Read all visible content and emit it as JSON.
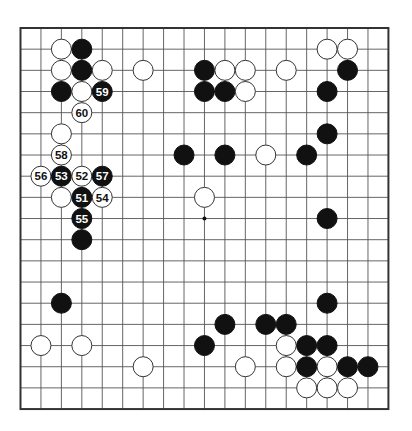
{
  "board": {
    "size": 19,
    "origin": {
      "x": 20.5,
      "y": 28
    },
    "spacing": {
      "x": 20.44,
      "y": 21.17
    },
    "stone_radius": 10,
    "colors": {
      "line": "#555555",
      "border": "#333333",
      "black": "#111111",
      "white": "#ffffff",
      "white_outline": "#333333",
      "black_label": "#ffffff",
      "white_label": "#111111"
    },
    "star_points": [
      [
        9,
        9
      ]
    ],
    "stones": [
      {
        "c": 2,
        "r": 1,
        "color": "white"
      },
      {
        "c": 3,
        "r": 1,
        "color": "black"
      },
      {
        "c": 15,
        "r": 1,
        "color": "white"
      },
      {
        "c": 16,
        "r": 1,
        "color": "white"
      },
      {
        "c": 2,
        "r": 2,
        "color": "white"
      },
      {
        "c": 3,
        "r": 2,
        "color": "black"
      },
      {
        "c": 4,
        "r": 2,
        "color": "white"
      },
      {
        "c": 6,
        "r": 2,
        "color": "white"
      },
      {
        "c": 9,
        "r": 2,
        "color": "black"
      },
      {
        "c": 10,
        "r": 2,
        "color": "white"
      },
      {
        "c": 11,
        "r": 2,
        "color": "white"
      },
      {
        "c": 13,
        "r": 2,
        "color": "white"
      },
      {
        "c": 16,
        "r": 2,
        "color": "black"
      },
      {
        "c": 2,
        "r": 3,
        "color": "black"
      },
      {
        "c": 3,
        "r": 3,
        "color": "white"
      },
      {
        "c": 4,
        "r": 3,
        "color": "black",
        "label": "59"
      },
      {
        "c": 9,
        "r": 3,
        "color": "black"
      },
      {
        "c": 10,
        "r": 3,
        "color": "black"
      },
      {
        "c": 11,
        "r": 3,
        "color": "white"
      },
      {
        "c": 15,
        "r": 3,
        "color": "black"
      },
      {
        "c": 3,
        "r": 4,
        "color": "white",
        "label": "60"
      },
      {
        "c": 2,
        "r": 5,
        "color": "white"
      },
      {
        "c": 15,
        "r": 5,
        "color": "black"
      },
      {
        "c": 2,
        "r": 6,
        "color": "white",
        "label": "58"
      },
      {
        "c": 8,
        "r": 6,
        "color": "black"
      },
      {
        "c": 10,
        "r": 6,
        "color": "black"
      },
      {
        "c": 12,
        "r": 6,
        "color": "white"
      },
      {
        "c": 14,
        "r": 6,
        "color": "black"
      },
      {
        "c": 1,
        "r": 7,
        "color": "white",
        "label": "56"
      },
      {
        "c": 2,
        "r": 7,
        "color": "black",
        "label": "53"
      },
      {
        "c": 3,
        "r": 7,
        "color": "white",
        "label": "52"
      },
      {
        "c": 4,
        "r": 7,
        "color": "black",
        "label": "57"
      },
      {
        "c": 2,
        "r": 8,
        "color": "white"
      },
      {
        "c": 3,
        "r": 8,
        "color": "black",
        "label": "51"
      },
      {
        "c": 4,
        "r": 8,
        "color": "white",
        "label": "54"
      },
      {
        "c": 9,
        "r": 8,
        "color": "white"
      },
      {
        "c": 3,
        "r": 9,
        "color": "black",
        "label": "55"
      },
      {
        "c": 15,
        "r": 9,
        "color": "black"
      },
      {
        "c": 3,
        "r": 10,
        "color": "black"
      },
      {
        "c": 2,
        "r": 13,
        "color": "black"
      },
      {
        "c": 15,
        "r": 13,
        "color": "black"
      },
      {
        "c": 10,
        "r": 14,
        "color": "black"
      },
      {
        "c": 12,
        "r": 14,
        "color": "black"
      },
      {
        "c": 13,
        "r": 14,
        "color": "black"
      },
      {
        "c": 1,
        "r": 15,
        "color": "white"
      },
      {
        "c": 3,
        "r": 15,
        "color": "white"
      },
      {
        "c": 9,
        "r": 15,
        "color": "black"
      },
      {
        "c": 13,
        "r": 15,
        "color": "white"
      },
      {
        "c": 14,
        "r": 15,
        "color": "black"
      },
      {
        "c": 15,
        "r": 15,
        "color": "black"
      },
      {
        "c": 6,
        "r": 16,
        "color": "white"
      },
      {
        "c": 11,
        "r": 16,
        "color": "white"
      },
      {
        "c": 13,
        "r": 16,
        "color": "white"
      },
      {
        "c": 14,
        "r": 16,
        "color": "black"
      },
      {
        "c": 15,
        "r": 16,
        "color": "white"
      },
      {
        "c": 16,
        "r": 16,
        "color": "black"
      },
      {
        "c": 17,
        "r": 16,
        "color": "black"
      },
      {
        "c": 14,
        "r": 17,
        "color": "white"
      },
      {
        "c": 15,
        "r": 17,
        "color": "white"
      },
      {
        "c": 16,
        "r": 17,
        "color": "white"
      }
    ]
  }
}
